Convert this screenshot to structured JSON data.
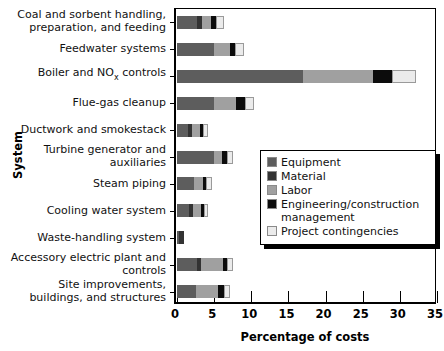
{
  "chart_data": {
    "type": "bar",
    "orientation": "horizontal",
    "stacked": true,
    "title": "",
    "xlabel": "Percentage of costs",
    "ylabel": "System",
    "xlim": [
      0,
      35
    ],
    "xticks": [
      0,
      5,
      10,
      15,
      20,
      25,
      30,
      35
    ],
    "grid": false,
    "legend_position": "center-right",
    "categories": [
      "Coal and sorbent handling,\npreparation, and feeding",
      "Feedwater systems",
      "Boiler and NOx controls",
      "Flue-gas cleanup",
      "Ductwork and smokestack",
      "Turbine generator and\nauxiliaries",
      "Steam piping",
      "Cooling water system",
      "Waste-handling system",
      "Accessory electric plant and\ncontrols",
      "Site improvements,\nbuildings, and structures"
    ],
    "series": [
      {
        "name": "Equipment",
        "color": "#5d5d5d",
        "values": [
          2.7,
          5.0,
          16.9,
          5.0,
          1.5,
          5.0,
          2.3,
          1.6,
          0.3,
          2.7,
          2.6
        ]
      },
      {
        "name": "Material",
        "color": "#333333",
        "values": [
          0.6,
          0.0,
          0.0,
          0.0,
          0.5,
          0.0,
          0.0,
          0.6,
          0.6,
          0.5,
          0.0
        ]
      },
      {
        "name": "Labor",
        "color": "#a0a0a0",
        "values": [
          1.3,
          2.2,
          9.5,
          3.0,
          1.1,
          1.0,
          1.2,
          1.0,
          0.0,
          3.0,
          2.9
        ]
      },
      {
        "name": "Engineering/construction\nmanagement",
        "color": "#0c0c0c",
        "values": [
          0.6,
          0.6,
          2.6,
          1.1,
          0.4,
          0.7,
          0.4,
          0.4,
          0.0,
          0.5,
          0.8
        ]
      },
      {
        "name": "Project contingencies",
        "color": "#ebebeb",
        "values": [
          1.1,
          1.2,
          3.2,
          1.3,
          0.7,
          0.8,
          0.8,
          0.6,
          0.0,
          0.8,
          0.8
        ]
      }
    ],
    "totals": [
      6.3,
      9.0,
      32.2,
      10.4,
      4.2,
      7.5,
      4.7,
      4.2,
      0.9,
      7.5,
      7.1
    ]
  },
  "legend": {
    "items": [
      {
        "label": "Equipment"
      },
      {
        "label": "Material"
      },
      {
        "label": "Labor"
      },
      {
        "label": "Engineering/construction\nmanagement"
      },
      {
        "label": "Project contingencies"
      }
    ]
  }
}
